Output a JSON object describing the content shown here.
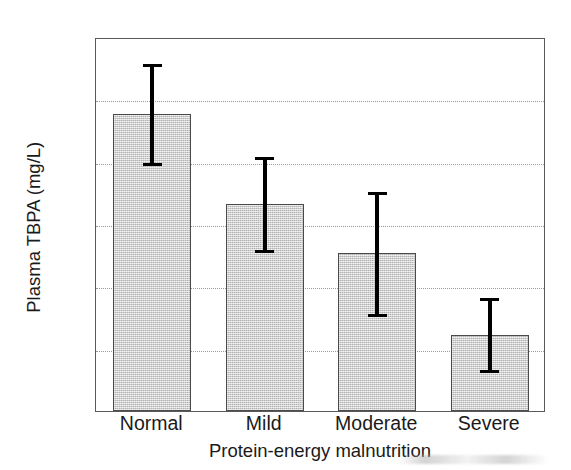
{
  "chart_data": {
    "type": "bar",
    "title": "",
    "xlabel": "Protein-energy malnutrition",
    "ylabel": "Plasma TBPA (mg/L)",
    "categories": [
      "Normal",
      "Mild",
      "Moderate",
      "Severe"
    ],
    "values": [
      238,
      166,
      127,
      61
    ],
    "error_low": [
      198,
      128,
      77,
      32
    ],
    "error_high": [
      280,
      205,
      177,
      92
    ],
    "ylim": [
      0,
      300
    ],
    "yticks": [
      0,
      50,
      100,
      150,
      200,
      250,
      300
    ],
    "ytick_labels": [
      "0",
      "50",
      "100",
      "150",
      "200",
      "250",
      "300"
    ],
    "grid": "horizontal-dotted",
    "gridline_values": [
      50,
      100,
      150,
      200,
      250
    ],
    "legend": "none",
    "bar_fill_color": "#c9c9c9",
    "bar_edge_color": "#4a4a4a",
    "errorbar_color": "#000000",
    "axis_color": "#5a5a5a",
    "background_color": "#ffffff"
  }
}
